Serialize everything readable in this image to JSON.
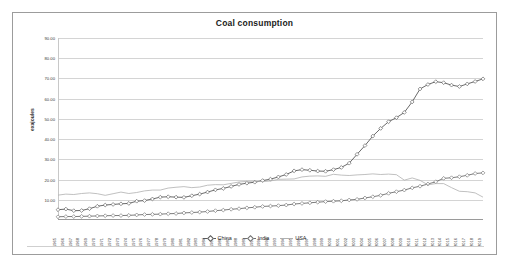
{
  "chart": {
    "title": "Coal consumption",
    "ylabel": "exajoules"
  },
  "legend": {
    "items": [
      {
        "label": "China",
        "color": "#595959",
        "marker": "diamond"
      },
      {
        "label": "India",
        "color": "#6e6e6e",
        "marker": "diamond"
      },
      {
        "label": "USA",
        "color": "#b0b0b0",
        "marker": "none"
      }
    ]
  },
  "chart_data": {
    "type": "line",
    "title": "Coal consumption",
    "xlabel": "",
    "ylabel": "exajoules",
    "ylim": [
      0,
      90
    ],
    "yticks": [
      "10.00",
      "20.00",
      "30.00",
      "40.00",
      "50.00",
      "60.00",
      "70.00",
      "80.00",
      "90.00"
    ],
    "grid": true,
    "legend_position": "bottom",
    "x": [
      1965,
      1966,
      1967,
      1968,
      1969,
      1970,
      1971,
      1972,
      1973,
      1974,
      1975,
      1976,
      1977,
      1978,
      1979,
      1980,
      1981,
      1982,
      1983,
      1984,
      1985,
      1986,
      1987,
      1988,
      1989,
      1990,
      1991,
      1992,
      1993,
      1994,
      1995,
      1996,
      1997,
      1998,
      1999,
      2000,
      2001,
      2002,
      2003,
      2004,
      2005,
      2006,
      2007,
      2008,
      2009,
      2010,
      2011,
      2012,
      2013,
      2014,
      2015,
      2016,
      2017,
      2018,
      2019
    ],
    "series": [
      {
        "name": "China",
        "color": "#595959",
        "values": [
          5.1,
          5.4,
          4.6,
          4.7,
          5.6,
          6.8,
          7.4,
          7.7,
          8.0,
          8.2,
          9.3,
          9.6,
          10.4,
          11.3,
          11.5,
          11.3,
          11.2,
          12.0,
          12.8,
          13.8,
          14.9,
          15.6,
          16.6,
          17.6,
          18.2,
          18.7,
          19.5,
          20.2,
          21.3,
          22.5,
          24.3,
          24.9,
          24.6,
          24.2,
          24.1,
          24.9,
          26.0,
          28.1,
          32.5,
          36.8,
          41.5,
          45.3,
          48.6,
          50.6,
          53.2,
          58.4,
          64.8,
          67.0,
          68.4,
          67.9,
          66.7,
          66.0,
          67.3,
          68.5,
          69.8
        ]
      },
      {
        "name": "India",
        "color": "#6e6e6e",
        "values": [
          1.6,
          1.7,
          1.7,
          1.8,
          1.9,
          2.0,
          2.1,
          2.2,
          2.2,
          2.3,
          2.5,
          2.7,
          2.8,
          2.9,
          3.1,
          3.2,
          3.5,
          3.7,
          3.9,
          4.2,
          4.6,
          4.9,
          5.3,
          5.6,
          6.0,
          6.3,
          6.7,
          6.9,
          7.1,
          7.4,
          7.9,
          8.2,
          8.5,
          8.8,
          9.1,
          9.3,
          9.5,
          9.9,
          10.2,
          10.9,
          11.5,
          12.2,
          13.2,
          14.0,
          14.8,
          15.9,
          16.7,
          17.8,
          18.9,
          20.6,
          20.9,
          21.4,
          22.1,
          23.0,
          23.3
        ]
      },
      {
        "name": "USA",
        "color": "#b0b0b0",
        "values": [
          12.3,
          12.8,
          12.6,
          13.1,
          13.4,
          13.0,
          12.2,
          13.0,
          13.8,
          13.1,
          13.6,
          14.4,
          14.8,
          14.8,
          15.8,
          16.2,
          16.5,
          16.0,
          16.3,
          17.2,
          17.5,
          17.4,
          18.1,
          18.8,
          19.1,
          19.2,
          19.0,
          19.3,
          20.1,
          20.2,
          20.3,
          21.3,
          21.7,
          21.8,
          21.6,
          22.6,
          22.2,
          22.0,
          22.3,
          22.5,
          22.8,
          22.5,
          22.7,
          22.4,
          19.7,
          20.8,
          19.6,
          17.4,
          18.0,
          18.0,
          16.0,
          14.2,
          14.0,
          13.4,
          11.3
        ]
      }
    ]
  }
}
